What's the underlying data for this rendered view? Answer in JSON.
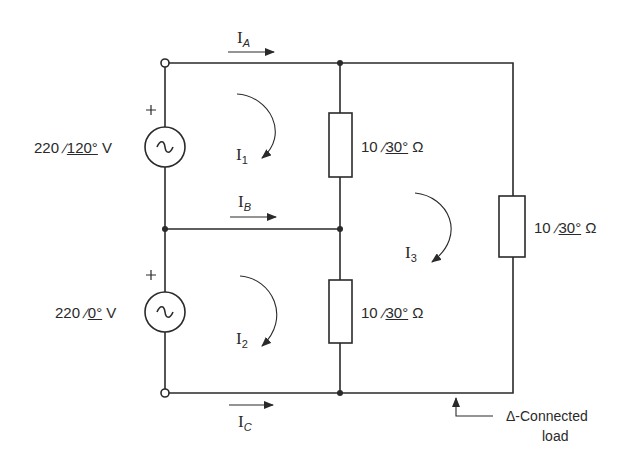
{
  "diagram": {
    "type": "three-phase circuit, mesh analysis",
    "sources": [
      {
        "id": "source-top",
        "magnitude": "220",
        "angle": "120°",
        "unit": "V",
        "polarity": "+"
      },
      {
        "id": "source-bottom",
        "magnitude": "220",
        "angle": "0°",
        "unit": "V",
        "polarity": "+"
      }
    ],
    "impedances": [
      {
        "id": "z-mid-top",
        "magnitude": "10",
        "angle": "30°",
        "unit": "Ω"
      },
      {
        "id": "z-mid-bottom",
        "magnitude": "10",
        "angle": "30°",
        "unit": "Ω"
      },
      {
        "id": "z-right",
        "magnitude": "10",
        "angle": "30°",
        "unit": "Ω"
      }
    ],
    "line_currents": [
      {
        "symbol": "I",
        "sub": "A"
      },
      {
        "symbol": "I",
        "sub": "B"
      },
      {
        "symbol": "I",
        "sub": "C"
      }
    ],
    "mesh_currents": [
      {
        "symbol": "I",
        "sub": "1"
      },
      {
        "symbol": "I",
        "sub": "2"
      },
      {
        "symbol": "I",
        "sub": "3"
      }
    ],
    "annotation": {
      "line1": "Δ-Connected",
      "line2": "load"
    }
  }
}
